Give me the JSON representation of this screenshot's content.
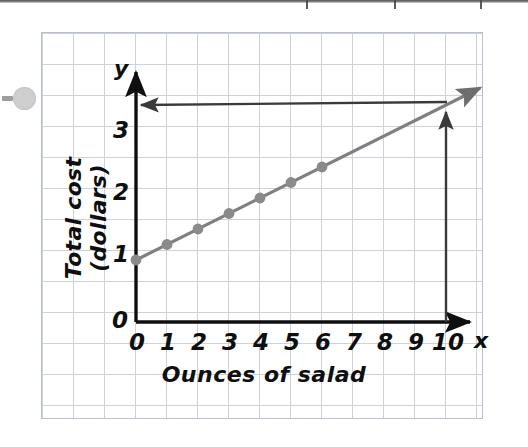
{
  "chart_data": {
    "type": "line",
    "title": "",
    "xlabel": "Ounces of salad",
    "ylabel": "Total cost (dollars)",
    "x_axis_var": "x",
    "y_axis_var": "y",
    "xlim": [
      0,
      10
    ],
    "ylim": [
      0,
      3.75
    ],
    "x_ticks": [
      "0",
      "1",
      "2",
      "3",
      "4",
      "5",
      "6",
      "7",
      "8",
      "9",
      "10"
    ],
    "y_ticks": [
      "0",
      "1",
      "2",
      "3"
    ],
    "grid": true,
    "legend": "none",
    "series": [
      {
        "name": "Total cost of salad",
        "equation": "y = 0.25x + 1",
        "intercept": 1,
        "slope": 0.25,
        "color": "#808080",
        "x": [
          0,
          1,
          2,
          3,
          4,
          5,
          6
        ],
        "values": [
          1,
          1.25,
          1.5,
          1.75,
          2,
          2.25,
          2.5
        ],
        "marked_points": [
          {
            "x": 0,
            "y": 1
          },
          {
            "x": 1,
            "y": 1.25
          },
          {
            "x": 2,
            "y": 1.5
          },
          {
            "x": 3,
            "y": 1.75
          },
          {
            "x": 4,
            "y": 2
          },
          {
            "x": 5,
            "y": 2.25
          },
          {
            "x": 6,
            "y": 2.5
          }
        ],
        "extends_with_arrow": true
      }
    ],
    "annotations": [
      {
        "kind": "vertical-arrow",
        "label": "trace up from x = 10",
        "from": {
          "x": 10,
          "y": 0
        },
        "to": {
          "x": 10,
          "y": 3.5
        },
        "color": "#2b2b2b"
      },
      {
        "kind": "horizontal-arrow",
        "label": "trace left to y = 3.5",
        "from": {
          "x": 10,
          "y": 3.5
        },
        "to": {
          "x": 0,
          "y": 3.5
        },
        "color": "#2b2b2b"
      }
    ]
  },
  "page": {
    "background_color": "#ffffff",
    "grid_line_color": "#cdd3dd",
    "axis_color": "#0f0f0f",
    "line_color": "#808080",
    "annotation_color": "#2b2b2b",
    "artifact_name": "hole-punch"
  },
  "labels": {
    "x_title": "Ounces of salad",
    "y_title": "Total cost (dollars)",
    "x_var": "x",
    "y_var": "y",
    "y_origin": "0",
    "x_0": "0",
    "x_1": "1",
    "x_2": "2",
    "x_3": "3",
    "x_4": "4",
    "x_5": "5",
    "x_6": "6",
    "x_7": "7",
    "x_8": "8",
    "x_9": "9",
    "x_10": "10",
    "y_1": "1",
    "y_2": "2",
    "y_3": "3"
  }
}
